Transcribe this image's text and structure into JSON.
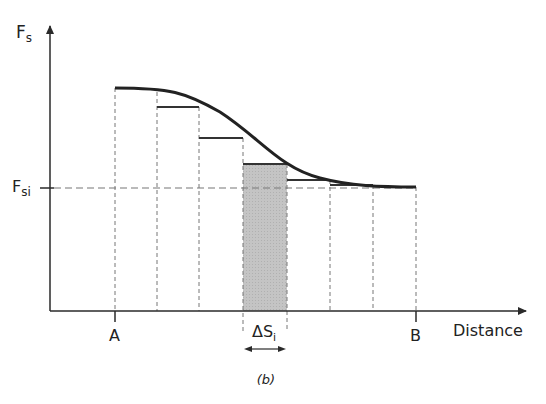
{
  "diagram": {
    "y_axis_label": "F",
    "y_axis_sub": "s",
    "ref_label": "F",
    "ref_sub": "si",
    "x_axis_label": "Distance",
    "point_a": "A",
    "point_b": "B",
    "delta_label": "ΔS",
    "delta_sub": "i",
    "caption": "(b)",
    "colors": {
      "line": "#2a2a2a",
      "dashed": "#777777",
      "shade": "#c8c8c8"
    },
    "dividers_x": [
      115,
      157,
      199,
      243,
      287,
      330,
      373,
      416
    ],
    "steps": [
      {
        "x1": 157,
        "x2": 199,
        "y": 107
      },
      {
        "x1": 199,
        "x2": 243,
        "y": 138
      },
      {
        "x1": 287,
        "x2": 330,
        "y": 180
      },
      {
        "x1": 330,
        "x2": 373,
        "y": 185
      }
    ],
    "shaded_strip": {
      "x1": 243,
      "x2": 287,
      "y_top": 164
    }
  }
}
